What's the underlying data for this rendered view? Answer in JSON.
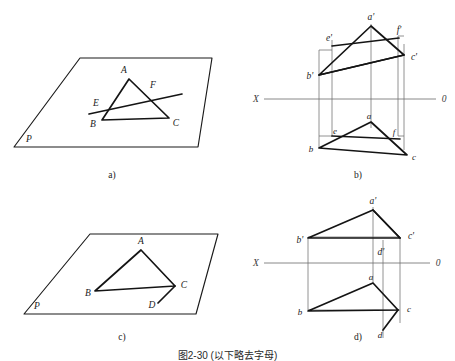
{
  "figure": {
    "title_caption": "图2-30  (以下略去字母)",
    "background_color": "#ffffff",
    "line_color": "#1a1a1a",
    "axis_color": "#7a7a7a",
    "projector_color": "#6d6d6d"
  },
  "panels": [
    {
      "id": "a",
      "caption": "a)",
      "type": "pictorial",
      "description": "Oblique plane P containing triangle ABC with a straight line EF crossing it",
      "plane_label": "P",
      "labels": [
        "A",
        "E",
        "F",
        "B",
        "C",
        "P"
      ]
    },
    {
      "id": "b",
      "caption": "b)",
      "type": "orthographic",
      "description": "Two-view projection: frontal view above XO axis, horizontal view below",
      "axis_left_label": "X",
      "axis_right_label": "0",
      "labels_upper": [
        "a'",
        "e'",
        "f'",
        "b'",
        "c'"
      ],
      "labels_lower": [
        "e",
        "a",
        "f",
        "b",
        "c"
      ]
    },
    {
      "id": "c",
      "caption": "c)",
      "type": "pictorial",
      "description": "Oblique plane P containing triangle ABC with point D below side BC",
      "plane_label": "P",
      "labels": [
        "A",
        "B",
        "C",
        "D",
        "P"
      ]
    },
    {
      "id": "d",
      "caption": "d)",
      "type": "orthographic",
      "description": "Two-view projection with point D: frontal view above XO axis, horizontal view below",
      "axis_left_label": "X",
      "axis_right_label": "0",
      "labels_upper": [
        "a'",
        "b'",
        "c'",
        "d'"
      ],
      "labels_lower": [
        "a",
        "b",
        "c",
        "d"
      ]
    }
  ],
  "panel_a": {
    "caption": "a)",
    "plane_label": "P",
    "vertices": {
      "A": "A",
      "E": "E",
      "F": "F",
      "B": "B",
      "C": "C"
    }
  },
  "panel_b": {
    "caption": "b)",
    "axis": {
      "left": "X",
      "right": "0"
    },
    "vertices": {
      "a_prime": "a'",
      "e_prime": "e'",
      "f_prime": "f'",
      "b_prime": "b'",
      "c_prime": "c'",
      "e": "e",
      "a": "a",
      "f": "f",
      "b": "b",
      "c": "c"
    }
  },
  "panel_c": {
    "caption": "c)",
    "plane_label": "P",
    "vertices": {
      "A": "A",
      "B": "B",
      "C": "C",
      "D": "D"
    }
  },
  "panel_d": {
    "caption": "d)",
    "axis": {
      "left": "X",
      "right": "0"
    },
    "vertices": {
      "a_prime": "a'",
      "b_prime": "b'",
      "c_prime": "c'",
      "d_prime": "d'",
      "a": "a",
      "b": "b",
      "c": "c",
      "d": "d"
    }
  }
}
